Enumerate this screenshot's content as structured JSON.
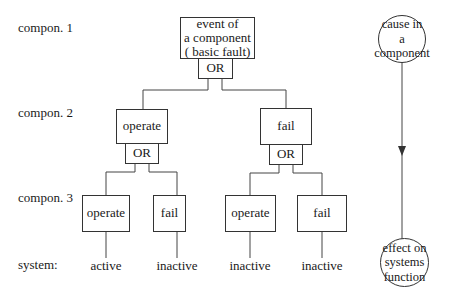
{
  "row_labels": {
    "compon1": "compon. 1",
    "compon2": "compon. 2",
    "compon3": "compon. 3",
    "system": "system:"
  },
  "tree": {
    "root": {
      "line1": "event of",
      "line2": "a component",
      "line3": "( basic fault)",
      "gate": "OR"
    },
    "level2": [
      {
        "label": "operate",
        "gate": "OR"
      },
      {
        "label": "fail",
        "gate": "OR"
      }
    ],
    "level3": [
      {
        "label": "operate",
        "system": "active"
      },
      {
        "label": "fail",
        "system": "inactive"
      },
      {
        "label": "operate",
        "system": "inactive"
      },
      {
        "label": "fail",
        "system": "inactive"
      }
    ]
  },
  "causality": {
    "cause": {
      "line1": "cause in a",
      "line2": "component"
    },
    "effect": {
      "line1": "effect on",
      "line2": "systems",
      "line3": "function"
    }
  }
}
